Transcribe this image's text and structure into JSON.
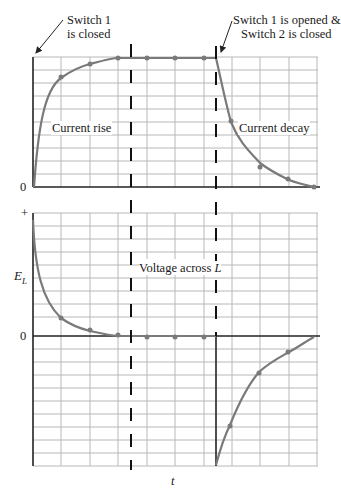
{
  "annotations": {
    "switch1_closed_line1": "Switch 1",
    "switch1_closed_line2": "is closed",
    "switch1_opened_line1": "Switch 1 is opened &",
    "switch1_opened_line2": "Switch 2 is closed",
    "current_rise": "Current rise",
    "current_decay": "Current decay",
    "voltage_across": "Voltage across ",
    "voltage_L": "L"
  },
  "axes": {
    "top_zero": "0",
    "bottom_plus": "+",
    "bottom_ylabel_main": "E",
    "bottom_ylabel_sub": "L",
    "bottom_zero": "0",
    "xlabel": "t"
  },
  "colors": {
    "grid": "#b8b8b8",
    "axis": "#222222",
    "curve": "#7a7a7a",
    "marker": "#7a7a7a",
    "dash": "#111111"
  },
  "diagram": {
    "top_panel": {
      "quantity": "current",
      "phases": [
        "Current rise",
        "Current decay"
      ],
      "rise_points_grid_x": [
        0,
        1,
        2,
        3,
        4,
        5,
        6
      ],
      "rise_values_pct": [
        0,
        63,
        86,
        95,
        98,
        100,
        100
      ],
      "decay_points_grid_x": [
        6.5,
        7,
        8,
        9,
        10
      ],
      "decay_values_pct": [
        100,
        37,
        14,
        5,
        0
      ]
    },
    "bottom_panel": {
      "quantity": "voltage across L",
      "rise_values_pct": [
        100,
        37,
        14,
        5,
        0,
        0,
        0
      ],
      "decay_values_pct": [
        -100,
        -63,
        -30,
        -12,
        0
      ]
    },
    "events": [
      "Switch 1 is closed",
      "Switch 1 is opened & Switch 2 is closed"
    ]
  }
}
